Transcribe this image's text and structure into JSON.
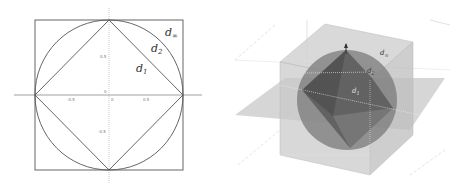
{
  "left_figure": {
    "title": "Unit balls in 2D",
    "labels": {
      "d_inf": "d",
      "d_inf_sub": "∞",
      "d2": "d",
      "d2_sub": "2",
      "d1": "d",
      "d1_sub": "1"
    },
    "x_ticks": [
      "-0.5",
      "0",
      "0.5"
    ],
    "y_ticks": [
      "0.5",
      "0",
      "-0.5"
    ],
    "colors": {
      "stroke": "#555555",
      "axis": "#888888"
    }
  },
  "right_figure": {
    "title": "Unit balls in 3D",
    "labels": {
      "d_inf": "d",
      "d_inf_sub": "∞",
      "d2": "d",
      "d2_sub": "2",
      "d1": "d",
      "d1_sub": "1"
    },
    "colors": {
      "cube": "#c8c8c8",
      "sphere": "#7a7a7a",
      "octahedron": "#5a5a5a",
      "plane": "#b5b5b5"
    }
  }
}
